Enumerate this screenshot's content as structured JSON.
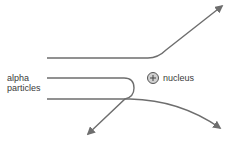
{
  "diagram": {
    "labels": {
      "alpha_line1": "alpha",
      "alpha_line2": "particles",
      "nucleus": "nucleus",
      "nucleus_symbol": "+"
    },
    "colors": {
      "path": "#6e6e6e",
      "nucleus_fill": "#d0d0d0",
      "nucleus_stroke": "#555555",
      "text": "#3a3a3a"
    },
    "paths": [
      {
        "name": "deflected-up",
        "description": "passes above nucleus, deflected upward"
      },
      {
        "name": "back-scattered",
        "description": "heads toward nucleus, bounces back"
      },
      {
        "name": "deflected-down",
        "description": "passes below nucleus, deflected downward"
      }
    ]
  }
}
